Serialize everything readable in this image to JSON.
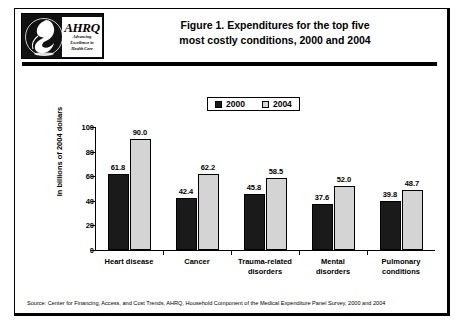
{
  "logo": {
    "name": "ahrq-logo",
    "acronym": "AHRQ",
    "tagline_line1": "Advancing",
    "tagline_line2": "Excellence in",
    "tagline_line3": "Health Care",
    "bird_icon": "bird-emblem-icon"
  },
  "title": {
    "line1": "Figure 1. Expenditures for the top five",
    "line2": "most costly conditions, 2000 and 2004"
  },
  "source": "Source: Center for Financing, Access, and Cost Trends, AHRQ, Household Component of the Medical Expenditure Panel Survey, 2000 and 2004",
  "colors": {
    "series_2000": "#1a1a1a",
    "series_2004": "#d4d4d4",
    "axis": "#000000",
    "background": "#ffffff"
  },
  "chart_data": {
    "type": "bar",
    "title": "Figure 1. Expenditures for the top five most costly conditions, 2000 and 2004",
    "xlabel": "",
    "ylabel": "In billions of 2004 dollars",
    "ylim": [
      0,
      100
    ],
    "yticks": [
      0,
      20,
      40,
      60,
      80,
      100
    ],
    "grid": false,
    "legend_position": "top-center",
    "categories": [
      "Heart disease",
      "Cancer",
      "Trauma-related disorders",
      "Mental disorders",
      "Pulmonary conditions"
    ],
    "category_lines": [
      [
        "Heart disease"
      ],
      [
        "Cancer"
      ],
      [
        "Trauma-related",
        "disorders"
      ],
      [
        "Mental",
        "disorders"
      ],
      [
        "Pulmonary",
        "conditions"
      ]
    ],
    "series": [
      {
        "name": "2000",
        "color": "#1a1a1a",
        "values": [
          61.8,
          42.4,
          45.8,
          37.6,
          39.8
        ],
        "labels": [
          "61.8",
          "42.4",
          "45.8",
          "37.6",
          "39.8"
        ]
      },
      {
        "name": "2004",
        "color": "#d4d4d4",
        "values": [
          90.0,
          62.2,
          58.5,
          52.0,
          48.7
        ],
        "labels": [
          "90.0",
          "62.2",
          "58.5",
          "52.0",
          "48.7"
        ]
      }
    ]
  }
}
